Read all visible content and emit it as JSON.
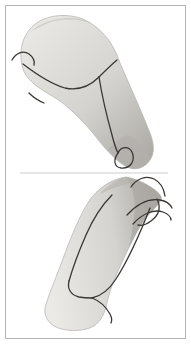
{
  "figure": {
    "panel_top": "shoulder-and-upper-arm-rendering",
    "panel_bottom": "upright-limb-rendering"
  },
  "colors": {
    "background": "#ffffff",
    "frame": "#b3b3b3",
    "divider": "#cdcdcd",
    "surfaceLight": "#eceae6",
    "surfaceMid": "#d5d3cf",
    "surfaceDark": "#aaa7a2",
    "endCap": "#b3b0ac",
    "ridge": "#b5b2ae",
    "curve": "#3a3734",
    "outline": "#bab8b4"
  },
  "geometry": {
    "frame": {
      "x": "5.5",
      "y": "5.5",
      "w": "180",
      "h": "333"
    },
    "divider": {
      "d": "M 20,173 L 168,173"
    },
    "top": {
      "body": "M 21,57 C 20,40 29,25 44,19 C 56,14 74,14 87,21 C 98,27 107,36 113,47 C 116,52 118,57 120,63 C 129,84 141,110 150,133 C 154,143 155,153 150,160 C 145,168 135,171 127,167 C 117,162 106,150 96,137 C 85,123 72,110 60,101 C 50,94 38,89 29,79 C 23,72 21,65 21,57 Z",
      "endCap": "M 128,135 C 138,140 146,149 150,159 C 146,167 136,171 128,167 C 120,163 113,155 108,149 C 114,143 121,138 128,135 Z",
      "topShade": "M 30,32 C 45,18 75,13 92,24 C 80,18 58,18 46,24 C 38,28 33,30 30,32 Z",
      "hook": "M 12,60 C 16,53 23,50 29,54 C 33,57 35,61 34,65",
      "mainContour": "M 23,64 C 36,74 51,84 65,88 C 79,91 91,85 99,77",
      "branchUp": "M 99,77 C 105,71 111,65 117,60",
      "armLine": "M 99,77 C 102,96 107,117 112,135 C 114,143 116,149 118,153",
      "tick": "M 29,93 C 34,98 39,101 44,103",
      "loop": "M 118,153 C 113,160 114,167 121,168 C 130,169 136,161 132,152 C 129,146 121,146 118,153"
    },
    "bottom": {
      "body": "M 126,177 C 137,179 147,184 155,190 C 160,194 162,197 161,200 C 157,207 149,213 143,222 C 135,234 127,251 119,269 C 113,282 109,293 107,303 C 105,313 101,321 94,326 C 84,332 64,332 54,326 C 46,321 43,313 46,304 C 50,292 57,275 64,256 C 71,237 79,217 89,201 C 97,189 111,179 126,177 Z",
      "rightBand": "M 126,177 C 137,179 147,184 155,190 C 160,194 162,197 161,200 C 157,207 149,213 143,222 C 138,229 133,239 129,248 C 132,232 135,216 135,205 C 134,193 131,183 126,177 Z",
      "apexRidge": "M 126,177 C 116,180 107,186 100,194 C 108,190 118,186 128,184 C 132,182 130,178 126,177 Z",
      "crescent": "M 131,187 C 136,179 146,175 154,179 C 160,182 164,189 165,196",
      "hookUpper": "M 127,215 C 137,204 149,198 160,200 C 166,201 170,204 172,208",
      "hookLower": "M 133,224 C 143,213 154,209 163,212 C 168,214 171,217 171,220",
      "crossing": "M 157,199 C 161,207 159,215 151,221 C 147,224 142,226 138,225",
      "leftLine": "M 112,195 C 102,205 93,219 86,235 C 79,251 73,267 69,281",
      "rightLine": "M 150,208 C 141,231 130,257 116,279 C 109,290 101,296 92,298",
      "vTurn": "M 69,281 C 67,289 71,295 79,297 C 84,298 89,298 92,298",
      "tail": "M 92,298 C 100,301 106,307 110,314 C 112,318 112,321 111,323"
    }
  }
}
